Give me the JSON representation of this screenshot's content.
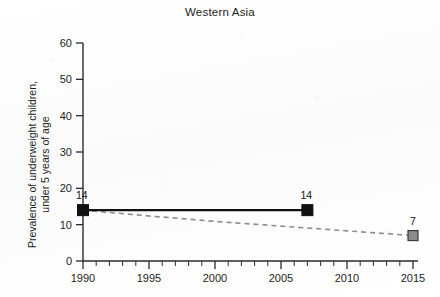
{
  "chart_data": {
    "type": "line",
    "title": "Western Asia",
    "xlabel": "",
    "ylabel": "Prevalence of underweight children,\nunder 5 years of age",
    "xlim": [
      1990,
      2015
    ],
    "ylim": [
      0,
      60
    ],
    "grid": false,
    "legend": "none",
    "x_ticks": [
      1990,
      1995,
      2000,
      2005,
      2010,
      2015
    ],
    "x_tick_labels": [
      "1990",
      "1995",
      "2000",
      "2005",
      "2010",
      "2015"
    ],
    "x_minor_tick_step": 1,
    "y_ticks": [
      0,
      10,
      20,
      30,
      40,
      50,
      60
    ],
    "y_tick_labels": [
      "0",
      "10",
      "20",
      "30",
      "40",
      "50",
      "60"
    ],
    "series": [
      {
        "name": "observed",
        "style": "solid",
        "color": "#111111",
        "marker": "square",
        "marker_color": "#111111",
        "points": [
          {
            "x": 1990,
            "y": 14,
            "label": "14"
          },
          {
            "x": 2007,
            "y": 14,
            "label": "14"
          }
        ]
      },
      {
        "name": "projected-trend",
        "style": "dashed",
        "color": "#8c8c8c",
        "marker": "square",
        "marker_color": "#8c8c8c",
        "points": [
          {
            "x": 1990,
            "y": 14,
            "label": ""
          },
          {
            "x": 1995,
            "y": 12.4,
            "label": ""
          },
          {
            "x": 2000,
            "y": 10.9,
            "label": ""
          },
          {
            "x": 2005,
            "y": 9.6,
            "label": ""
          },
          {
            "x": 2010,
            "y": 8.3,
            "label": ""
          },
          {
            "x": 2015,
            "y": 7,
            "label": "7"
          }
        ]
      }
    ],
    "annotations": [
      {
        "text": "14",
        "x": 1990,
        "y": 14
      },
      {
        "text": "14",
        "x": 2007,
        "y": 14
      },
      {
        "text": "7",
        "x": 2015,
        "y": 7
      }
    ],
    "colors": {
      "axis": "#2b2b2b",
      "observed_line": "#111111",
      "trend_line": "#8c8c8c",
      "trend_marker_fill": "#8c8c8c",
      "background": "#fdfdfd"
    }
  }
}
